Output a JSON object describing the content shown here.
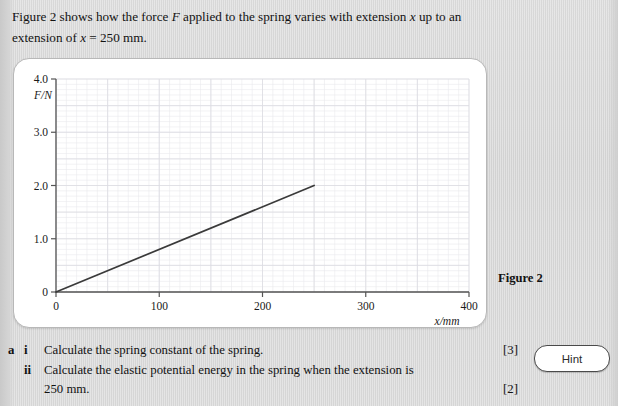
{
  "intro": {
    "line1_a": "Figure 2 shows how the force ",
    "line1_F": "F",
    "line1_b": " applied to the spring varies with extension ",
    "line1_x": "x",
    "line1_c": " up to an",
    "line2_a": "extension of ",
    "line2_x": "x",
    "line2_b": " = 250 mm."
  },
  "figure": {
    "caption": "Figure 2"
  },
  "chart_data": {
    "type": "line",
    "title": "",
    "xlabel": "x/mm",
    "ylabel": "F/N",
    "xlim": [
      0,
      400
    ],
    "ylim": [
      0,
      4.0
    ],
    "xticks": [
      0,
      100,
      200,
      300,
      400
    ],
    "xticklabels": [
      "0",
      "100",
      "200",
      "300",
      "400"
    ],
    "yticks": [
      0,
      1.0,
      2.0,
      3.0,
      4.0
    ],
    "yticklabels": [
      "0",
      "1.0",
      "2.0",
      "3.0",
      "4.0"
    ],
    "grid": true,
    "grid_minor_step_x": 10,
    "grid_major_step_x": 50,
    "grid_minor_step_y": 0.1,
    "grid_major_step_y": 0.5,
    "legend": null,
    "line_color": "#3a3a3a",
    "series": [
      {
        "name": "Force vs extension",
        "x": [
          0,
          250
        ],
        "y": [
          0.0,
          2.0
        ]
      }
    ]
  },
  "question": {
    "letter": "a",
    "parts": [
      {
        "roman": "i",
        "text": "Calculate the spring constant of the spring.",
        "marks": "[3]"
      },
      {
        "roman": "ii",
        "text": "Calculate the elastic potential energy in the spring when the extension is",
        "marks": ""
      },
      {
        "roman": "",
        "text": "250 mm.",
        "marks": "[2]"
      }
    ]
  },
  "hint": {
    "label": "Hint"
  }
}
